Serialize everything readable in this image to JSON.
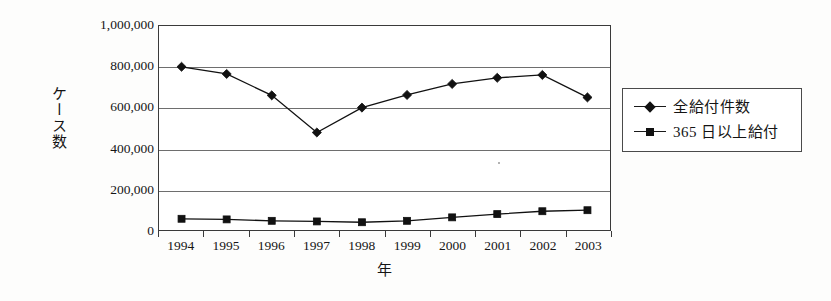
{
  "chart_data": {
    "type": "line",
    "title": "",
    "xlabel": "年",
    "ylabel": "ケース数",
    "categories": [
      "1994",
      "1995",
      "1996",
      "1997",
      "1998",
      "1999",
      "2000",
      "2001",
      "2002",
      "2003"
    ],
    "ylim": [
      0,
      1000000
    ],
    "ytick_values": [
      1000000,
      800000,
      600000,
      400000,
      200000,
      0
    ],
    "ytick_labels": [
      "1,000,000",
      "800,000",
      "600,000",
      "400,000",
      "200,000",
      "0"
    ],
    "grid": true,
    "legend_position": "right",
    "series": [
      {
        "name": "全給付件数",
        "marker": "diamond",
        "color": "#111111",
        "values": [
          800000,
          765000,
          660000,
          478000,
          600000,
          662000,
          716000,
          746000,
          760000,
          650000
        ]
      },
      {
        "name": "365 日以上給付",
        "marker": "square",
        "color": "#111111",
        "values": [
          55000,
          52000,
          45000,
          42000,
          38000,
          45000,
          62000,
          78000,
          92000,
          97000
        ]
      }
    ]
  },
  "legend": {
    "entries": [
      {
        "label": "全給付件数",
        "marker": "diamond"
      },
      {
        "label": "365 日以上給付",
        "marker": "square"
      }
    ]
  }
}
